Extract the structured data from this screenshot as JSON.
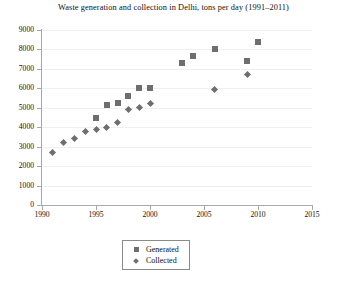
{
  "chart_data": {
    "type": "scatter",
    "title": "Waste generation and collection in Delhi, tons per day (1991–2011)",
    "xlabel": "",
    "ylabel": "",
    "xlim": [
      1990,
      2015
    ],
    "ylim": [
      0,
      9000
    ],
    "xticks": [
      1990,
      1995,
      2000,
      2005,
      2010,
      2015
    ],
    "xtick_labels": [
      "1990",
      "1995",
      "2000",
      "2005",
      "2010",
      "2015"
    ],
    "yticks": [
      0,
      1000,
      2000,
      3000,
      4000,
      5000,
      6000,
      7000,
      8000,
      9000
    ],
    "ytick_labels": [
      "0",
      "1000",
      "2000",
      "3000",
      "4000",
      "5000",
      "6000",
      "7000",
      "8000",
      "9000"
    ],
    "grid": true,
    "legend_position": "bottom-center",
    "marker_color": "#6e6e6e",
    "series": [
      {
        "name": "Generated",
        "marker": "square",
        "points": [
          {
            "x": 1995,
            "y": 4500
          },
          {
            "x": 1996,
            "y": 5150
          },
          {
            "x": 1997,
            "y": 5250
          },
          {
            "x": 1998,
            "y": 5600
          },
          {
            "x": 1999,
            "y": 6000
          },
          {
            "x": 2000,
            "y": 6000
          },
          {
            "x": 2003,
            "y": 7300
          },
          {
            "x": 2004,
            "y": 7650
          },
          {
            "x": 2006,
            "y": 8000
          },
          {
            "x": 2009,
            "y": 7400
          },
          {
            "x": 2010,
            "y": 8400
          }
        ]
      },
      {
        "name": "Collected",
        "marker": "diamond",
        "points": [
          {
            "x": 1991,
            "y": 2700
          },
          {
            "x": 1992,
            "y": 3200
          },
          {
            "x": 1993,
            "y": 3400
          },
          {
            "x": 1994,
            "y": 3800
          },
          {
            "x": 1995,
            "y": 3900
          },
          {
            "x": 1996,
            "y": 4000
          },
          {
            "x": 1997,
            "y": 4250
          },
          {
            "x": 1998,
            "y": 4900
          },
          {
            "x": 1999,
            "y": 5000
          },
          {
            "x": 2000,
            "y": 5200
          },
          {
            "x": 2006,
            "y": 5950
          },
          {
            "x": 2009,
            "y": 6700
          }
        ]
      }
    ],
    "legend": [
      {
        "label": "Generated",
        "marker": "square"
      },
      {
        "label": "Collected",
        "marker": "diamond"
      }
    ]
  }
}
